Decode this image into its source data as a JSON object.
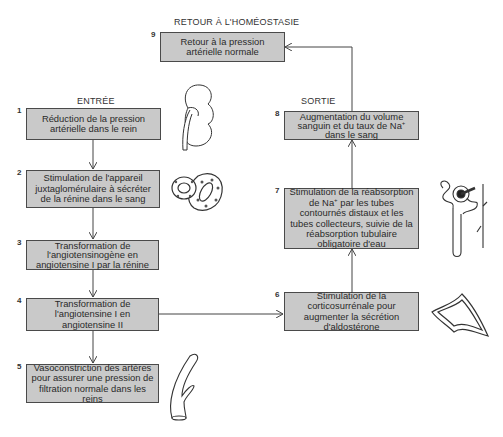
{
  "headings": {
    "top": "RETOUR À L'HOMÉOSTASIE",
    "left": "ENTRÉE",
    "right": "SORTIE"
  },
  "steps": [
    {
      "number": "1",
      "text": "Réduction de la pression artérielle dans le rein"
    },
    {
      "number": "2",
      "text": "Stimulation de l'appareil juxtaglomérulaire à sécréter de la rénine dans le sang"
    },
    {
      "number": "3",
      "text": "Transformation de l'angiotensinogène en angiotensine I par la rénine"
    },
    {
      "number": "4",
      "text": "Transformation de l'angiotensine I en angiotensine II"
    },
    {
      "number": "5",
      "text": "Vasoconstriction des artères pour assurer une pression de filtration normale dans les reins"
    },
    {
      "number": "6",
      "text": "Stimulation de la corticosurrénale pour augmenter la sécrétion d'aldostérone"
    },
    {
      "number": "7",
      "text_parts": [
        "Stimulation de la réabsorption de Na",
        "+",
        " par les tubes contournés distaux et les tubes collecteurs, suivie de la réabsorption tubulaire obligatoire d'eau"
      ]
    },
    {
      "number": "8",
      "text_parts": [
        "Augmentation du volume sanguin et du taux de Na",
        "+",
        " dans le sang"
      ]
    },
    {
      "number": "9",
      "text": "Retour à la pression artérielle normale"
    }
  ],
  "illustrations": [
    "kidney-icon",
    "juxtaglomerular-apparatus-icon",
    "nephron-icon",
    "adrenal-cortex-icon",
    "artery-icon"
  ],
  "colors": {
    "box_fill": "#c9c9c9",
    "box_border": "#4a4a4a",
    "line": "#444444"
  }
}
